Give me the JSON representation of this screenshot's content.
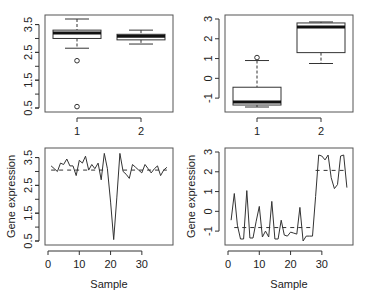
{
  "chart_data": [
    {
      "panel": "top-left",
      "type": "box",
      "categories": [
        "1",
        "2"
      ],
      "ylim": [
        0.5,
        3.7
      ],
      "yticks": [
        0.5,
        1.5,
        2.5,
        3.5
      ],
      "ytick_labels": [
        "0.5",
        "1.5",
        "2.5",
        "3.5"
      ],
      "boxes": [
        {
          "name": "1",
          "whisker_low": 2.65,
          "q1": 3.0,
          "median": 3.2,
          "q3": 3.3,
          "whisker_high": 3.7,
          "outliers": [
            2.2,
            0.55
          ]
        },
        {
          "name": "2",
          "whisker_low": 2.8,
          "q1": 2.95,
          "median": 3.08,
          "q3": 3.15,
          "whisker_high": 3.3,
          "outliers": []
        }
      ],
      "xlabel": "",
      "ylabel": ""
    },
    {
      "panel": "top-right",
      "type": "box",
      "categories": [
        "1",
        "2"
      ],
      "ylim": [
        -1.5,
        3.0
      ],
      "yticks": [
        -1,
        0,
        1,
        2,
        3
      ],
      "ytick_labels": [
        "-1",
        "0",
        "1",
        "2",
        "3"
      ],
      "boxes": [
        {
          "name": "1",
          "whisker_low": -1.45,
          "q1": -1.35,
          "median": -1.2,
          "q3": -0.45,
          "whisker_high": 0.9,
          "outliers": [
            1.05
          ]
        },
        {
          "name": "2",
          "whisker_low": 0.75,
          "q1": 1.3,
          "median": 2.6,
          "q3": 2.8,
          "whisker_high": 2.85,
          "outliers": []
        }
      ],
      "xlabel": "",
      "ylabel": ""
    },
    {
      "panel": "bottom-left",
      "type": "line",
      "x": [
        1,
        2,
        3,
        4,
        5,
        6,
        7,
        8,
        9,
        10,
        11,
        12,
        13,
        14,
        15,
        16,
        17,
        18,
        19,
        20,
        21,
        22,
        23,
        24,
        25,
        26,
        27,
        28,
        29,
        30,
        31,
        32,
        33,
        34,
        35,
        36,
        37,
        38
      ],
      "values": [
        3.2,
        3.1,
        3.0,
        3.3,
        3.25,
        3.45,
        3.2,
        3.2,
        2.85,
        3.4,
        3.3,
        3.55,
        3.05,
        3.25,
        3.1,
        3.3,
        2.7,
        3.65,
        3.1,
        1.9,
        0.55,
        2.05,
        3.65,
        3.0,
        2.9,
        2.75,
        3.25,
        3.15,
        3.05,
        2.95,
        3.25,
        3.1,
        2.95,
        3.1,
        3.2,
        2.85,
        3.05,
        3.15
      ],
      "segments": [
        {
          "x_start": 1,
          "x_end": 19,
          "mean": 3.05
        },
        {
          "x_start": 24,
          "x_end": 38,
          "mean": 3.05
        }
      ],
      "xlim": [
        0,
        39
      ],
      "ylim": [
        0.5,
        3.7
      ],
      "xticks": [
        0,
        10,
        20,
        30
      ],
      "yticks": [
        0.5,
        1.5,
        2.5,
        3.5
      ],
      "ytick_labels": [
        "0.5",
        "1.5",
        "2.5",
        "3.5"
      ],
      "xlabel": "Sample",
      "ylabel": "Gene expression"
    },
    {
      "panel": "bottom-right",
      "type": "line",
      "x": [
        1,
        2,
        3,
        4,
        5,
        6,
        7,
        8,
        9,
        10,
        11,
        12,
        13,
        14,
        15,
        16,
        17,
        18,
        19,
        20,
        21,
        22,
        23,
        24,
        25,
        26,
        27,
        28,
        29,
        30,
        31,
        32,
        33,
        34,
        35,
        36,
        37,
        38
      ],
      "values": [
        -0.45,
        0.9,
        -0.7,
        -1.4,
        -1.4,
        1.05,
        -1.35,
        -1.35,
        -0.5,
        0.25,
        -1.3,
        -1.0,
        -1.3,
        0.5,
        -1.4,
        -1.4,
        -0.45,
        -1.2,
        -1.25,
        -1.05,
        -1.1,
        -1.15,
        0.2,
        -1.5,
        -1.25,
        -1.25,
        -1.25,
        0.75,
        2.85,
        2.8,
        2.6,
        2.85,
        1.7,
        1.15,
        1.35,
        2.8,
        2.85,
        1.2
      ],
      "segments": [
        {
          "x_start": 2,
          "x_end": 27,
          "mean": -0.82
        },
        {
          "x_start": 28,
          "x_end": 38,
          "mean": 2.07
        }
      ],
      "xlim": [
        0,
        39
      ],
      "ylim": [
        -1.5,
        3.0
      ],
      "xticks": [
        0,
        10,
        20,
        30
      ],
      "yticks": [
        -1,
        0,
        1,
        2,
        3
      ],
      "ytick_labels": [
        "-1",
        "0",
        "1",
        "2",
        "3"
      ],
      "xlabel": "Sample",
      "ylabel": "Gene expression"
    }
  ]
}
